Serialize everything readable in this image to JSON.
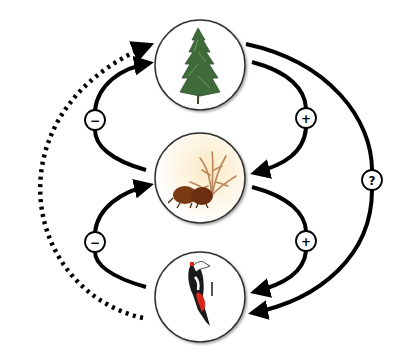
{
  "diagram": {
    "type": "trophic-cascade",
    "nodes": [
      {
        "id": "tree",
        "label": "Tree (conifer)",
        "icon": "conifer-tree-icon"
      },
      {
        "id": "beetle",
        "label": "Bark beetle with fungus",
        "icon": "bark-beetle-icon"
      },
      {
        "id": "bird",
        "label": "Woodpecker",
        "icon": "woodpecker-icon"
      }
    ],
    "edges": [
      {
        "from": "tree",
        "to": "beetle",
        "sign": "+",
        "style": "solid"
      },
      {
        "from": "beetle",
        "to": "bird",
        "sign": "+",
        "style": "solid"
      },
      {
        "from": "beetle",
        "to": "tree",
        "sign": "−",
        "style": "solid"
      },
      {
        "from": "bird",
        "to": "beetle",
        "sign": "−",
        "style": "solid"
      },
      {
        "from": "tree",
        "to": "bird",
        "sign": "?",
        "style": "solid"
      },
      {
        "from": "bird",
        "to": "tree",
        "sign": "",
        "style": "dotted"
      }
    ],
    "badges": {
      "minus_top": "−",
      "minus_bottom": "−",
      "plus_top": "+",
      "plus_bottom": "+",
      "question": "?"
    },
    "colors": {
      "line": "#000000",
      "circle_stroke": "#444444",
      "tree_green": "#3f6b3a",
      "beetle_brown": "#7a3a14",
      "fungus_tan": "#b9855a",
      "bird_red": "#d8261c"
    }
  }
}
